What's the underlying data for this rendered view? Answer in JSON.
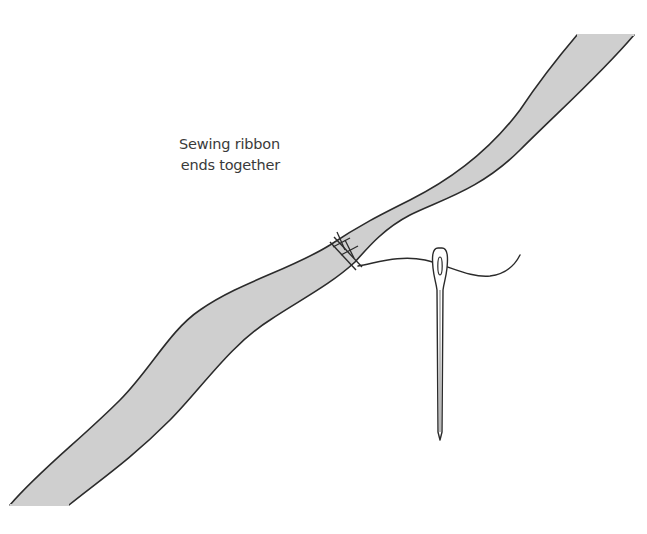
{
  "figure": {
    "caption": {
      "line1": "Sewing ribbon",
      "line2": "ends together"
    },
    "colors": {
      "background": "#ffffff",
      "ribbon_fill": "#cfcfcf",
      "outline": "#2b2b2b",
      "caption_text": "#3a3a3a"
    },
    "elements": [
      {
        "name": "ribbon",
        "description": "wavy diagonal ribbon strip"
      },
      {
        "name": "stitches",
        "description": "cross stitches joining ribbon ends"
      },
      {
        "name": "thread",
        "description": "thread running from stitches through needle eye"
      },
      {
        "name": "needle",
        "description": "sewing needle, pointing down"
      }
    ]
  }
}
